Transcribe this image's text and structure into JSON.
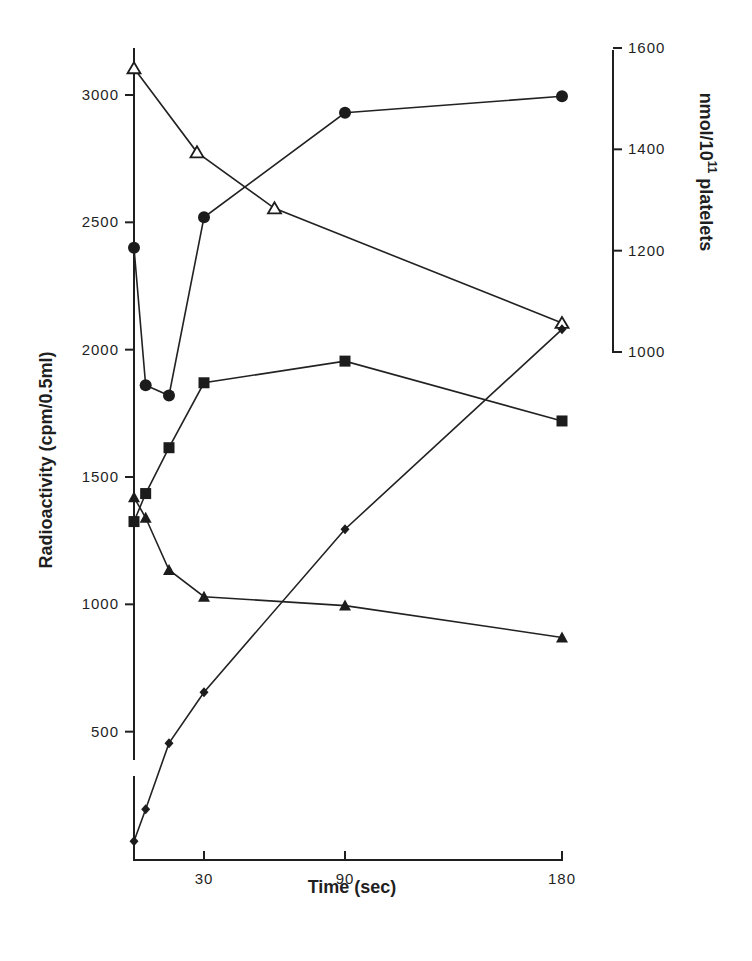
{
  "chart_data": {
    "type": "line",
    "title": "",
    "xlabel": "Time (sec)",
    "ylabel": "Radioactivity (cpm/0.5ml)",
    "y2label": "nmol/10^11 platelets",
    "x_ticks": [
      {
        "value": 30,
        "label": "30",
        "px": 204
      },
      {
        "value": 90,
        "label": "90",
        "px": 345
      },
      {
        "value": 180,
        "label": "180",
        "px": 562
      }
    ],
    "x_scale_note": "non-linear time axis",
    "y_ticks": [
      {
        "value": 500,
        "label": "500"
      },
      {
        "value": 1000,
        "label": "1000"
      },
      {
        "value": 1500,
        "label": "1500"
      },
      {
        "value": 2000,
        "label": "2000"
      },
      {
        "value": 2500,
        "label": "2500"
      },
      {
        "value": 3000,
        "label": "3000"
      }
    ],
    "ylim": [
      0,
      3200
    ],
    "y2_ticks": [
      {
        "value": 1000,
        "label": "1000"
      },
      {
        "value": 1200,
        "label": "1200"
      },
      {
        "value": 1400,
        "label": "1400"
      },
      {
        "value": 1600,
        "label": "1600"
      }
    ],
    "y2lim": [
      1000,
      1600
    ],
    "grid": false,
    "legend": null,
    "series": [
      {
        "name": "filled circles",
        "marker": "circle-filled",
        "x": [
          0,
          5,
          15,
          30,
          90,
          180
        ],
        "values": [
          2400,
          1860,
          1820,
          2520,
          2930,
          2995
        ]
      },
      {
        "name": "open triangles",
        "marker": "triangle-open",
        "x": [
          0,
          27,
          60,
          180
        ],
        "values": [
          3105,
          2775,
          2555,
          2105
        ]
      },
      {
        "name": "filled squares",
        "marker": "square-filled",
        "x": [
          0,
          5,
          15,
          30,
          90,
          180
        ],
        "values": [
          1325,
          1435,
          1615,
          1870,
          1955,
          1720
        ]
      },
      {
        "name": "filled triangles",
        "marker": "triangle-filled",
        "x": [
          0,
          5,
          15,
          30,
          90,
          180
        ],
        "values": [
          1420,
          1340,
          1135,
          1030,
          995,
          870
        ]
      },
      {
        "name": "filled diamonds",
        "marker": "diamond-filled",
        "x": [
          0,
          5,
          15,
          30,
          90,
          180
        ],
        "values": [
          70,
          195,
          455,
          655,
          1295,
          2080
        ]
      }
    ]
  },
  "labels": {
    "xlabel": "Time (sec)",
    "ylabel": "Radioactivity (cpm/0.5ml)",
    "y2label_main": "nmol/10",
    "y2label_sup": "11",
    "y2label_tail": " platelets"
  }
}
